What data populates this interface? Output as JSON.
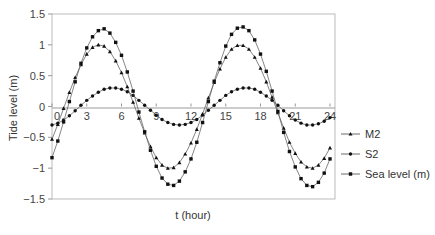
{
  "chart_data": {
    "type": "line",
    "title": "",
    "xlabel": "t (hour)",
    "ylabel": "Tide level (m)",
    "xlim": [
      0,
      24
    ],
    "ylim": [
      -1.5,
      1.5
    ],
    "x_ticks": [
      0,
      3,
      6,
      9,
      12,
      15,
      18,
      21,
      24
    ],
    "y_ticks": [
      -1.5,
      -1,
      -0.5,
      0,
      0.5,
      1,
      1.5
    ],
    "y_tick_labels": [
      "−1.5",
      "−1",
      "−0.5",
      "0",
      "0.5",
      "1",
      "1.5"
    ],
    "grid": false,
    "legend_position": "right",
    "x": [
      0,
      0.5,
      1,
      1.5,
      2,
      2.5,
      3,
      3.5,
      4,
      4.5,
      5,
      5.5,
      6,
      6.5,
      7,
      7.5,
      8,
      8.5,
      9,
      9.5,
      10,
      10.5,
      11,
      11.5,
      12,
      12.5,
      13,
      13.5,
      14,
      14.5,
      15,
      15.5,
      16,
      16.5,
      17,
      17.5,
      18,
      18.5,
      19,
      19.5,
      20,
      20.5,
      21,
      21.5,
      22,
      22.5,
      23,
      23.5,
      24
    ],
    "series": [
      {
        "name": "M2",
        "marker": "triangle",
        "values": [
          -0.53,
          -0.29,
          -0.03,
          0.23,
          0.47,
          0.68,
          0.85,
          0.96,
          1.0,
          0.98,
          0.89,
          0.74,
          0.55,
          0.32,
          0.07,
          -0.19,
          -0.43,
          -0.65,
          -0.83,
          -0.95,
          -1.0,
          -0.99,
          -0.91,
          -0.77,
          -0.59,
          -0.37,
          -0.12,
          0.14,
          0.39,
          0.61,
          0.8,
          0.93,
          0.99,
          0.99,
          0.93,
          0.8,
          0.62,
          0.4,
          0.15,
          -0.1,
          -0.35,
          -0.58,
          -0.76,
          -0.9,
          -0.98,
          -1.0,
          -0.95,
          -0.84,
          -0.67
        ]
      },
      {
        "name": "S2",
        "marker": "circle",
        "values": [
          -0.3,
          -0.27,
          -0.22,
          -0.15,
          -0.07,
          0.02,
          0.1,
          0.17,
          0.23,
          0.28,
          0.3,
          0.3,
          0.28,
          0.24,
          0.18,
          0.1,
          0.02,
          -0.06,
          -0.14,
          -0.21,
          -0.26,
          -0.29,
          -0.3,
          -0.29,
          -0.26,
          -0.21,
          -0.14,
          -0.06,
          0.02,
          0.1,
          0.18,
          0.24,
          0.28,
          0.3,
          0.3,
          0.28,
          0.23,
          0.17,
          0.1,
          0.02,
          -0.07,
          -0.15,
          -0.22,
          -0.27,
          -0.3,
          -0.3,
          -0.28,
          -0.24,
          -0.18
        ]
      },
      {
        "name": "Sea level (m)",
        "marker": "square",
        "values": [
          -0.83,
          -0.56,
          -0.25,
          0.08,
          0.4,
          0.7,
          0.95,
          1.13,
          1.23,
          1.26,
          1.19,
          1.04,
          0.83,
          0.56,
          0.25,
          -0.09,
          -0.41,
          -0.71,
          -0.97,
          -1.16,
          -1.26,
          -1.28,
          -1.21,
          -1.06,
          -0.85,
          -0.58,
          -0.26,
          0.08,
          0.41,
          0.71,
          0.98,
          1.17,
          1.27,
          1.29,
          1.23,
          1.08,
          0.85,
          0.57,
          0.25,
          -0.08,
          -0.42,
          -0.73,
          -0.98,
          -1.17,
          -1.28,
          -1.3,
          -1.23,
          -1.08,
          -0.85
        ]
      }
    ]
  },
  "legend": {
    "items": [
      {
        "label": "M2",
        "marker": "triangle"
      },
      {
        "label": "S2",
        "marker": "circle"
      },
      {
        "label": "Sea level (m)",
        "marker": "square"
      }
    ]
  },
  "colors": {
    "line": "#666666",
    "marker": "#111111",
    "axis": "#999999",
    "frame": "#bbbbbb"
  }
}
